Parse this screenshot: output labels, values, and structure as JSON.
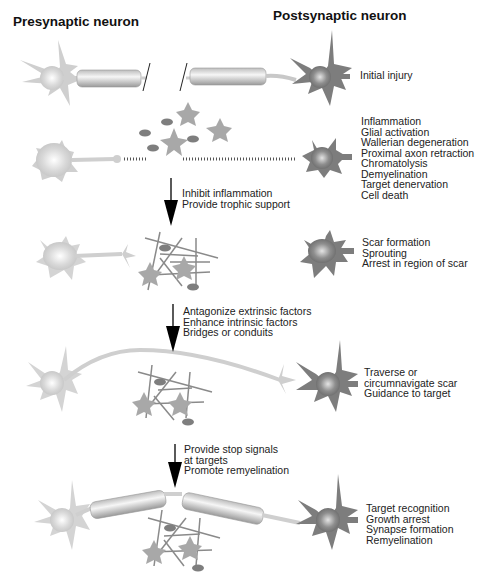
{
  "headers": {
    "presynaptic": "Presynaptic neuron",
    "postsynaptic": "Postsynaptic neuron"
  },
  "stages": [
    {
      "id": "initial",
      "outcomes": [
        "Initial injury"
      ]
    },
    {
      "id": "acute",
      "outcomes": [
        "Inflammation",
        "Glial activation",
        "Wallerian degeneration",
        "Proximal axon retraction",
        "Chromatolysis",
        "Demyelination",
        "Target denervation",
        "Cell death"
      ]
    },
    {
      "id": "scar",
      "outcomes": [
        "Scar formation",
        "Sprouting",
        "Arrest in region of scar"
      ]
    },
    {
      "id": "regrowth",
      "outcomes": [
        "Traverse or",
        "circumnavigate scar",
        "Guidance to target"
      ]
    },
    {
      "id": "recovery",
      "outcomes": [
        "Target recognition",
        "Growth arrest",
        "Synapse formation",
        "Remyelination"
      ]
    }
  ],
  "interventions": [
    {
      "lines": [
        "Inhibit inflammation",
        "Provide trophic support"
      ]
    },
    {
      "lines": [
        "Antagonize extrinsic factors",
        "Enhance intrinsic factors",
        "Bridges or conduits"
      ]
    },
    {
      "lines": [
        "Provide stop signals",
        "at targets",
        "Promote remyelination"
      ]
    }
  ],
  "colors": {
    "presynaptic_cell": "#c8c8c8",
    "postsynaptic_cell": "#7a7a7a",
    "glia": "#a9a9a9",
    "microglia": "#8a8a8a",
    "arrow": "#000000"
  }
}
